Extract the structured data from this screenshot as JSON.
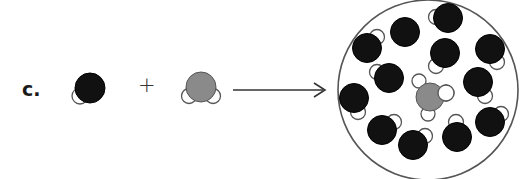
{
  "problem": {
    "label": "c.",
    "operator": "+",
    "arrow": "right-arrow"
  },
  "colors": {
    "solvent_atom": "#111111",
    "solute_atom": "#8a8a8a",
    "hydrogen_atom": "#ffffff",
    "outline": "#555555",
    "container_outline": "#555555"
  },
  "reactants": [
    {
      "name": "solvent-molecule",
      "center_atom": {
        "cx": 90,
        "cy": 88,
        "r": 15,
        "color": "#111111"
      },
      "hydrogens": [
        {
          "cx": 80,
          "cy": 96,
          "r": 8
        }
      ]
    },
    {
      "name": "solute-molecule",
      "center_atom": {
        "cx": 201,
        "cy": 87,
        "r": 15,
        "color": "#8a8a8a"
      },
      "hydrogens": [
        {
          "cx": 189,
          "cy": 96,
          "r": 7.5
        },
        {
          "cx": 213,
          "cy": 96,
          "r": 7.5
        }
      ]
    }
  ],
  "product": {
    "container": {
      "cx": 428,
      "cy": 90,
      "r": 90
    },
    "solute": {
      "center_atom": {
        "cx": 430,
        "cy": 97,
        "r": 14,
        "color": "#8a8a8a"
      },
      "hydrogens": [
        {
          "cx": 419,
          "cy": 81,
          "r": 7
        },
        {
          "cx": 446,
          "cy": 93,
          "r": 8
        },
        {
          "cx": 428,
          "cy": 114,
          "r": 7
        }
      ]
    },
    "solvent_molecules": [
      {
        "cx": 448,
        "cy": 18,
        "r": 14.5,
        "h": {
          "cx": 436,
          "cy": 17,
          "r": 7.5
        }
      },
      {
        "cx": 405,
        "cy": 32,
        "r": 14.5,
        "h": null
      },
      {
        "cx": 367,
        "cy": 48,
        "r": 14.5,
        "h": {
          "cx": 377,
          "cy": 37,
          "r": 7.5
        }
      },
      {
        "cx": 445,
        "cy": 53,
        "r": 14.5,
        "h": {
          "cx": 436,
          "cy": 66,
          "r": 7.5
        }
      },
      {
        "cx": 490,
        "cy": 49,
        "r": 14.5,
        "h": {
          "cx": 497,
          "cy": 62,
          "r": 7.5
        }
      },
      {
        "cx": 389,
        "cy": 78,
        "r": 14.5,
        "h": {
          "cx": 377,
          "cy": 72,
          "r": 7.5
        }
      },
      {
        "cx": 478,
        "cy": 82,
        "r": 14.5,
        "h": {
          "cx": 485,
          "cy": 96,
          "r": 7.5
        }
      },
      {
        "cx": 354,
        "cy": 98,
        "r": 14.5,
        "h": {
          "cx": 358,
          "cy": 112,
          "r": 7.5
        }
      },
      {
        "cx": 382,
        "cy": 130,
        "r": 14.5,
        "h": {
          "cx": 394,
          "cy": 122,
          "r": 7.5
        }
      },
      {
        "cx": 490,
        "cy": 122,
        "r": 14.5,
        "h": {
          "cx": 501,
          "cy": 114,
          "r": 7.5
        }
      },
      {
        "cx": 413,
        "cy": 145,
        "r": 14.5,
        "h": {
          "cx": 425,
          "cy": 136,
          "r": 7.5
        }
      },
      {
        "cx": 457,
        "cy": 137,
        "r": 14.5,
        "h": {
          "cx": 456,
          "cy": 122,
          "r": 7.5
        }
      }
    ]
  }
}
